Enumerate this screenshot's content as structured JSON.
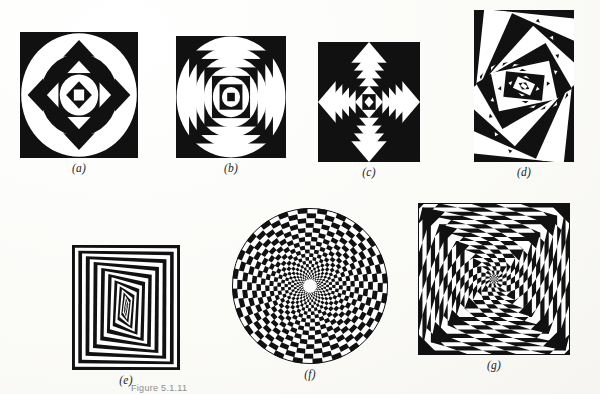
{
  "page": {
    "background_color": "#fdfdfb",
    "ink_color": "#111111",
    "plate_caption": "Figure 5.1.11"
  },
  "figures": [
    {
      "id": "a",
      "label": "(a)",
      "name": "nested-squares-diamonds-circles",
      "description": "Square frame filled with alternating axis-aligned squares, 45-degree rotated squares and concentric circles, black and white",
      "x": 20,
      "y": 32,
      "w": 118,
      "h": 126,
      "rings": 9,
      "motifs": [
        "square",
        "diamond",
        "circle"
      ],
      "has_circles": true,
      "rotation": 0
    },
    {
      "id": "b",
      "label": "(b)",
      "name": "nested-squares-circles",
      "description": "Square frame with concentric circles alternating with axis-aligned squares, black and white",
      "x": 176,
      "y": 36,
      "w": 110,
      "h": 122,
      "rings": 9,
      "motifs": [
        "square",
        "circle"
      ],
      "has_circles": true,
      "rotation": 0
    },
    {
      "id": "c",
      "label": "(c)",
      "name": "nested-squares-diamonds",
      "description": "Square frame of alternating axis-aligned squares and 45-degree rotated squares, no circles",
      "x": 318,
      "y": 42,
      "w": 102,
      "h": 120,
      "rings": 9,
      "motifs": [
        "square",
        "diamond"
      ],
      "has_circles": false,
      "rotation": 0
    },
    {
      "id": "d",
      "label": "(d)",
      "name": "rotated-nested-rectangles",
      "description": "Tall rectangle of progressively rotated nested rectangles creating a dense radiating moire",
      "x": 474,
      "y": 10,
      "w": 100,
      "h": 152,
      "rings": 22,
      "motifs": [
        "rectangle"
      ],
      "has_circles": false,
      "rotation": 6
    },
    {
      "id": "e",
      "label": "(e)",
      "name": "squares-morphing-to-lens",
      "description": "Nested square bands that progressively deform into a pointed lens or diamond shape at the centre",
      "x": 72,
      "y": 245,
      "w": 108,
      "h": 125,
      "rings": 11,
      "motifs": [
        "square",
        "lens"
      ],
      "has_circles": false,
      "rotation": 0
    },
    {
      "id": "f",
      "label": "(f)",
      "name": "polar-checkerboard-disc",
      "description": "Circular disc tiled with a polar checkerboard of radial sectors and concentric rings, white hole at centre",
      "x": 232,
      "y": 208,
      "w": 156,
      "h": 156,
      "sectors": 48,
      "rings": 20,
      "motifs": [
        "checkerboard",
        "circle"
      ],
      "has_circles": true,
      "rotation": 0
    },
    {
      "id": "g",
      "label": "(g)",
      "name": "spiral-vortex-squares",
      "description": "Square frame of nested squares each rotated a little, radial black and white wedges forming a spiral vortex",
      "x": 418,
      "y": 203,
      "w": 152,
      "h": 152,
      "rings": 26,
      "sectors": 20,
      "motifs": [
        "square",
        "spiral"
      ],
      "has_circles": false,
      "rotation": 9
    }
  ],
  "captions": {
    "a": "(a)",
    "b": "(b)",
    "c": "(c)",
    "d": "(d)",
    "e": "(e)",
    "f": "(f)",
    "g": "(g)"
  }
}
